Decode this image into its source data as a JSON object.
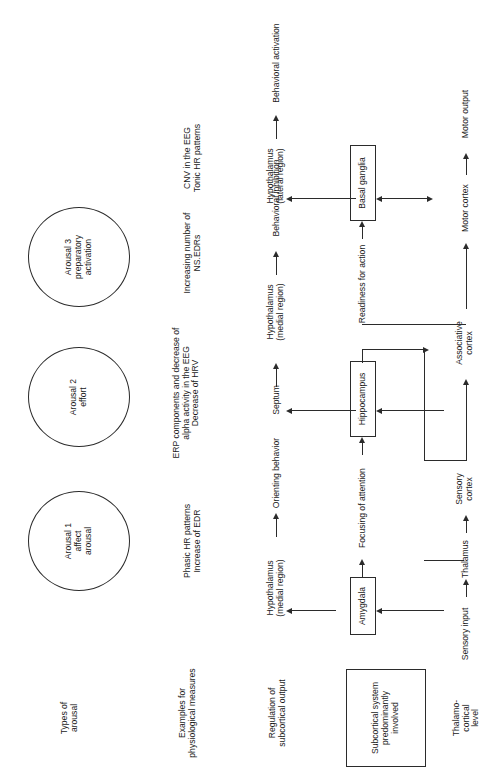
{
  "figure": {
    "orientation": "rotated-90-ccw",
    "line_color": "#2b2b2b",
    "background": "#ffffff"
  },
  "row_labels": {
    "types": "Types of\narousal",
    "measures": "Examples for\nphysiological measures",
    "regulation": "Regulation of\nsubcortical output",
    "subcortical": "Subcortical system\npredominantly\ninvolved",
    "thalamo": "Thalamo-\ncortical\nlevel"
  },
  "arousal_types": [
    {
      "id": "arousal1",
      "label": "Arousal 1\naffect\narousal"
    },
    {
      "id": "arousal2",
      "label": "Arousal 2\neffort"
    },
    {
      "id": "arousal3",
      "label": "Arousal 3\npreparatory\nactivation"
    }
  ],
  "physiological_measures": [
    {
      "id": "measure1",
      "label": "Phasic HR patterns\nIncrease of EDR"
    },
    {
      "id": "measure2",
      "label": "ERP components and decrease of\nalpha activity in the EEG\nDecrease of HRV"
    },
    {
      "id": "measure3",
      "label": "Increasing number of\nNS.EDRs"
    },
    {
      "id": "measure4",
      "label": "CNV in the EEG\nTonic HR patterns"
    }
  ],
  "regulation_nodes": [
    {
      "id": "hypo-medial-1",
      "label": "Hypothalamus\n(medial region)"
    },
    {
      "id": "orienting-behavior",
      "label": "Orienting behavior"
    },
    {
      "id": "septum",
      "label": "Septum"
    },
    {
      "id": "hypo-medial-2",
      "label": "Hypothalamus\n(medial region)"
    },
    {
      "id": "behavioral-inhibition",
      "label": "Behavioral inhibition"
    },
    {
      "id": "hypo-lateral",
      "label": "Hypothalamus\n(lateral region)"
    },
    {
      "id": "behavioral-activation",
      "label": "Behavioral activation"
    }
  ],
  "subcortical_nodes": [
    {
      "id": "amygdala",
      "label": "Amygdala"
    },
    {
      "id": "focusing-of-attention",
      "label": "Focusing of attention"
    },
    {
      "id": "hippocampus",
      "label": "Hippocampus"
    },
    {
      "id": "readiness-for-action",
      "label": "Readiness for action"
    },
    {
      "id": "basal-ganglia",
      "label": "Basal ganglia"
    }
  ],
  "thalamo_nodes": [
    {
      "id": "sensory-input",
      "label": "Sensory input"
    },
    {
      "id": "thalamus",
      "label": "Thalamus"
    },
    {
      "id": "sensory-cortex",
      "label": "Sensory\ncortex"
    },
    {
      "id": "associative-cortex",
      "label": "Associative\ncortex"
    },
    {
      "id": "motor-cortex",
      "label": "Motor cortex"
    },
    {
      "id": "motor-output",
      "label": "Motor output"
    }
  ]
}
